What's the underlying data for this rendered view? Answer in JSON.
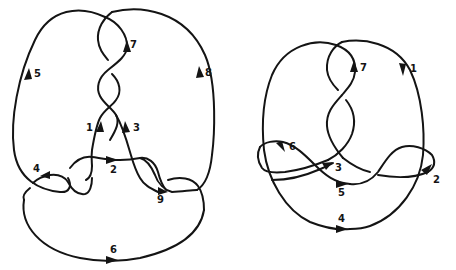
{
  "figure": {
    "background": "#ffffff",
    "ink_color": "#141414",
    "diagrams": [
      {
        "name": "left-knot",
        "arc_labels": [
          {
            "id": "1",
            "text": "1",
            "x": 86,
            "y": 131
          },
          {
            "id": "2",
            "text": "2",
            "x": 110,
            "y": 173
          },
          {
            "id": "3",
            "text": "3",
            "x": 133,
            "y": 131
          },
          {
            "id": "4",
            "text": "4",
            "x": 33,
            "y": 172
          },
          {
            "id": "5",
            "text": "5",
            "x": 34,
            "y": 77
          },
          {
            "id": "6",
            "text": "6",
            "x": 110,
            "y": 253
          },
          {
            "id": "7",
            "text": "7",
            "x": 130,
            "y": 48
          },
          {
            "id": "8",
            "text": "8",
            "x": 205,
            "y": 76
          },
          {
            "id": "9",
            "text": "9",
            "x": 157,
            "y": 203
          }
        ]
      },
      {
        "name": "right-knot",
        "arc_labels": [
          {
            "id": "1",
            "text": "1",
            "x": 410,
            "y": 72
          },
          {
            "id": "2",
            "text": "2",
            "x": 433,
            "y": 183
          },
          {
            "id": "3",
            "text": "3",
            "x": 335,
            "y": 171
          },
          {
            "id": "4",
            "text": "4",
            "x": 338,
            "y": 222
          },
          {
            "id": "5",
            "text": "5",
            "x": 338,
            "y": 196
          },
          {
            "id": "6",
            "text": "6",
            "x": 289,
            "y": 150
          },
          {
            "id": "7",
            "text": "7",
            "x": 360,
            "y": 71
          }
        ]
      }
    ]
  }
}
